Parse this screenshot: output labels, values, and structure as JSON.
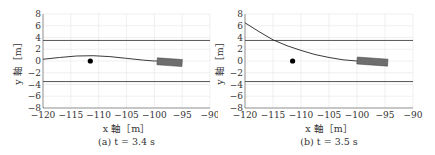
{
  "chart_data": [
    {
      "type": "line",
      "caption": "(a) t = 3.4 s",
      "xlabel": "x 軸［m］",
      "ylabel": "y 軸［m］",
      "xlim": [
        -120,
        -90
      ],
      "ylim": [
        -8,
        8
      ],
      "xticks": [
        -120,
        -115,
        -110,
        -105,
        -100,
        -95,
        -90
      ],
      "yticks": [
        8,
        6,
        4,
        2,
        0,
        -2,
        -4,
        -6,
        -8
      ],
      "grid": true,
      "lane_lines": [
        3.5,
        -3.5
      ],
      "obstacle": {
        "x": -111.5,
        "y": 0
      },
      "vehicle": {
        "x_min": -99.5,
        "x_max": -95,
        "y_center": -0.2,
        "angle_deg": -4
      },
      "trajectory": {
        "x": [
          -120,
          -117,
          -114,
          -111,
          -108,
          -105,
          -102,
          -100,
          -98
        ],
        "y": [
          0.3,
          0.6,
          0.85,
          0.9,
          0.75,
          0.45,
          0.15,
          0.0,
          0.0
        ]
      }
    },
    {
      "type": "line",
      "caption": "(b) t = 3.5 s",
      "xlabel": "x 軸［m］",
      "ylabel": "y 軸［m］",
      "xlim": [
        -120,
        -90
      ],
      "ylim": [
        -8,
        8
      ],
      "xticks": [
        -120,
        -115,
        -110,
        -105,
        -100,
        -95,
        -90
      ],
      "yticks": [
        8,
        6,
        4,
        2,
        0,
        -2,
        -4,
        -6,
        -8
      ],
      "grid": true,
      "lane_lines": [
        3.5,
        -3.5
      ],
      "obstacle": {
        "x": -111.5,
        "y": 0
      },
      "vehicle": {
        "x_min": -100,
        "x_max": -94.5,
        "y_center": -0.1,
        "angle_deg": -4
      },
      "trajectory": {
        "x": [
          -120,
          -117.5,
          -115,
          -112.5,
          -110,
          -107.5,
          -105,
          -102.5,
          -100,
          -98
        ],
        "y": [
          6.5,
          5.0,
          3.6,
          2.6,
          1.8,
          1.1,
          0.6,
          0.2,
          0.0,
          0.0
        ]
      }
    }
  ]
}
